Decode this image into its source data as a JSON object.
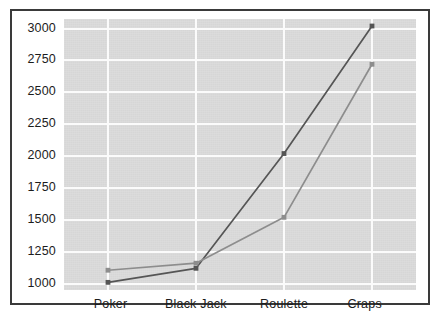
{
  "chart_data": {
    "type": "line",
    "title": "",
    "subtitle": "",
    "xlabel": "",
    "ylabel": "",
    "categories": [
      "Poker",
      "Black Jack",
      "Roulette",
      "Craps"
    ],
    "series": [
      {
        "name": "series-dark",
        "color": "#555555",
        "marker": "square",
        "values": [
          1010,
          1120,
          2020,
          3020
        ]
      },
      {
        "name": "series-light",
        "color": "#8d8d8d",
        "marker": "square",
        "values": [
          1105,
          1160,
          1520,
          2720
        ]
      }
    ],
    "ylim": [
      950,
      3075
    ],
    "yticks": [
      1000,
      1250,
      1500,
      1750,
      2000,
      2250,
      2500,
      2750,
      3000
    ],
    "ytick_labels": [
      "1000",
      "1250",
      "1500",
      "1750",
      "2000",
      "2250",
      "2500",
      "2750",
      "3000"
    ],
    "grid": true,
    "grid_color": "#fbfbfb",
    "plot_background": "#d9d9d9",
    "legend": null,
    "legend_position": "none"
  },
  "figure": {
    "border_color": "#3a3a3a",
    "background": "#ffffff"
  }
}
